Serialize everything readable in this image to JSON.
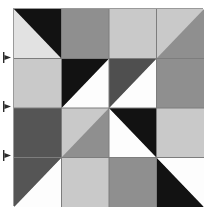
{
  "figure": {
    "kind": "geometric-tile-grid",
    "width_px": 207,
    "height_px": 217
  },
  "palette": {
    "black": "#121212",
    "dark_gray": "#555555",
    "mid_dark_gray": "#4f4f4f",
    "medium_gray": "#8f8f8f",
    "light_gray": "#c9c9c9",
    "pale_gray": "#e2e2e2",
    "white": "#fdfdfd",
    "grid_line": "#7d7d7d",
    "frame_border": "#9a9a9a",
    "marker_fill": "#2b2b2b",
    "background": "#ffffff"
  },
  "grid": {
    "rows": 4,
    "columns": 4,
    "origin_x": 13,
    "origin_y": 8,
    "cell_width": 47.5,
    "cell_height": 49.5,
    "line_width": 1,
    "cells": [
      {
        "row": 1,
        "col": 1,
        "type": "split-diagonal",
        "diagonal": "tl-br",
        "upper_label": "upper-right-triangle",
        "upper_color": "#121212",
        "lower_label": "lower-left-triangle",
        "lower_color": "#e2e2e2"
      },
      {
        "row": 1,
        "col": 2,
        "type": "solid",
        "label": "solid-medium-gray",
        "color": "#8f8f8f"
      },
      {
        "row": 1,
        "col": 3,
        "type": "solid",
        "label": "solid-light-gray",
        "color": "#c9c9c9"
      },
      {
        "row": 1,
        "col": 4,
        "type": "split-diagonal",
        "diagonal": "tr-bl",
        "upper_label": "upper-left-triangle",
        "upper_color": "#c9c9c9",
        "lower_label": "lower-right-triangle",
        "lower_color": "#8f8f8f"
      },
      {
        "row": 2,
        "col": 1,
        "type": "solid",
        "label": "solid-light-gray",
        "color": "#c9c9c9"
      },
      {
        "row": 2,
        "col": 2,
        "type": "split-diagonal",
        "diagonal": "tr-bl",
        "upper_label": "upper-left-triangle",
        "upper_color": "#121212",
        "lower_label": "lower-right-triangle",
        "lower_color": "#fdfdfd"
      },
      {
        "row": 2,
        "col": 3,
        "type": "split-diagonal",
        "diagonal": "tr-bl",
        "upper_label": "upper-left-triangle",
        "upper_color": "#4f4f4f",
        "lower_label": "lower-right-triangle",
        "lower_color": "#fdfdfd"
      },
      {
        "row": 2,
        "col": 4,
        "type": "solid",
        "label": "solid-medium-gray",
        "color": "#8f8f8f"
      },
      {
        "row": 3,
        "col": 1,
        "type": "solid",
        "label": "solid-dark-gray",
        "color": "#555555"
      },
      {
        "row": 3,
        "col": 2,
        "type": "split-diagonal",
        "diagonal": "tr-bl",
        "upper_label": "upper-left-triangle",
        "upper_color": "#c9c9c9",
        "lower_label": "lower-right-triangle",
        "lower_color": "#8f8f8f"
      },
      {
        "row": 3,
        "col": 3,
        "type": "split-diagonal",
        "diagonal": "tl-br",
        "upper_label": "upper-right-triangle",
        "upper_color": "#121212",
        "lower_label": "lower-left-triangle",
        "lower_color": "#fdfdfd"
      },
      {
        "row": 3,
        "col": 4,
        "type": "solid",
        "label": "solid-light-gray",
        "color": "#c9c9c9"
      },
      {
        "row": 4,
        "col": 1,
        "type": "split-diagonal",
        "diagonal": "tr-bl",
        "upper_label": "upper-left-triangle",
        "upper_color": "#555555",
        "lower_label": "lower-right-triangle",
        "lower_color": "#fdfdfd"
      },
      {
        "row": 4,
        "col": 2,
        "type": "solid",
        "label": "solid-light-gray",
        "color": "#c9c9c9"
      },
      {
        "row": 4,
        "col": 3,
        "type": "solid",
        "label": "solid-medium-gray",
        "color": "#8f8f8f"
      },
      {
        "row": 4,
        "col": 4,
        "type": "split-diagonal",
        "diagonal": "tl-br",
        "upper_label": "upper-right-triangle",
        "upper_color": "#fdfdfd",
        "lower_label": "lower-left-triangle",
        "lower_color": "#121212"
      }
    ]
  },
  "edge_markers": [
    {
      "name": "row-boundary-marker-1",
      "y": 52,
      "glyph": "right-pointing-tick"
    },
    {
      "name": "row-boundary-marker-2",
      "y": 101,
      "glyph": "right-pointing-tick"
    },
    {
      "name": "row-boundary-marker-3",
      "y": 150,
      "glyph": "right-pointing-tick"
    }
  ]
}
